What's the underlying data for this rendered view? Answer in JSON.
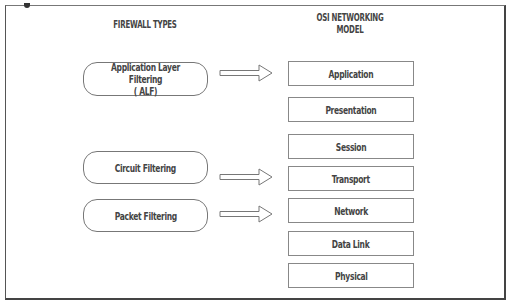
{
  "diagram": {
    "headings": {
      "firewall_types": "FIREWALL TYPES",
      "osi_model": "OSI NETWORKING\nMODEL"
    },
    "firewall_types": [
      {
        "label": "Application Layer Filtering\n( ALF)",
        "maps_to": "Application"
      },
      {
        "label": "Circuit Filtering",
        "maps_to": "Transport"
      },
      {
        "label": "Packet Filtering",
        "maps_to": "Network"
      }
    ],
    "osi_layers": [
      {
        "label": "Application"
      },
      {
        "label": "Presentation"
      },
      {
        "label": "Session"
      },
      {
        "label": "Transport"
      },
      {
        "label": "Network"
      },
      {
        "label": "Data Link"
      },
      {
        "label": "Physical"
      }
    ],
    "arrows": [
      {
        "from": "Application Layer Filtering ( ALF)",
        "to": "Application",
        "icon": "hollow-right-arrow"
      },
      {
        "from": "Circuit Filtering",
        "to": "Transport",
        "icon": "hollow-right-arrow"
      },
      {
        "from": "Packet Filtering",
        "to": "Network",
        "icon": "hollow-right-arrow"
      }
    ],
    "colors": {
      "stroke": "#777777",
      "text": "#444444",
      "background": "#ffffff"
    }
  }
}
